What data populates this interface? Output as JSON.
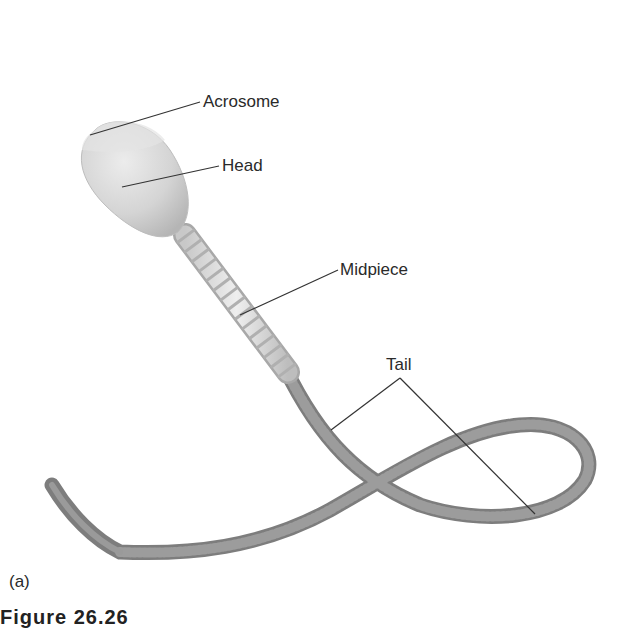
{
  "diagram": {
    "panel_label": "(a)",
    "caption_partial": "Figure 26.26",
    "labels": [
      {
        "id": "acrosome",
        "text": "Acrosome",
        "x": 203,
        "y": 93
      },
      {
        "id": "head",
        "text": "Head",
        "x": 222,
        "y": 157
      },
      {
        "id": "midpiece",
        "text": "Midpiece",
        "x": 340,
        "y": 261
      },
      {
        "id": "tail",
        "text": "Tail",
        "x": 386,
        "y": 356
      }
    ],
    "colors": {
      "head_fill": "#d9d9d9",
      "midpiece_fill": "#dcdcdc",
      "tail_fill": "#8e8e8e",
      "leader_line": "#333333",
      "text": "#2a2a2a"
    }
  }
}
